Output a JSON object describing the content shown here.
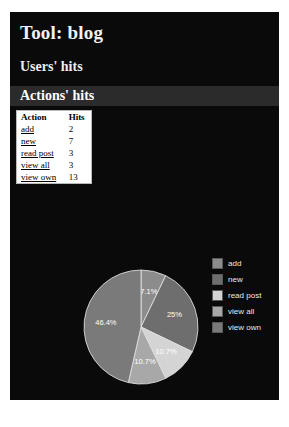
{
  "page": {
    "title": "Tool: blog",
    "section_users": "Users' hits",
    "section_actions": "Actions' hits",
    "background_color": "#0a0a0a",
    "highlight_band_color": "#2b2b2b"
  },
  "table": {
    "headers": [
      "Action",
      "Hits"
    ],
    "rows": [
      {
        "action": "add",
        "hits": "2"
      },
      {
        "action": "new",
        "hits": "7"
      },
      {
        "action": "read post",
        "hits": "3"
      },
      {
        "action": "view all",
        "hits": "3"
      },
      {
        "action": "view own",
        "hits": "13"
      }
    ]
  },
  "legend": {
    "items": [
      {
        "label": "add",
        "color": "#8c8c8c"
      },
      {
        "label": "new",
        "color": "#6e6e6e"
      },
      {
        "label": "read post",
        "color": "#d4d4d4"
      },
      {
        "label": "view all",
        "color": "#a8a8a8"
      },
      {
        "label": "view own",
        "color": "#7a7a7a"
      }
    ]
  },
  "chart_data": {
    "type": "pie",
    "title": "Actions' hits",
    "categories": [
      "add",
      "new",
      "read post",
      "view all",
      "view own"
    ],
    "values": [
      2,
      7,
      3,
      3,
      13
    ],
    "total": 28,
    "percent_labels": [
      "7.1%",
      "25%",
      "10.7%",
      "10.7%",
      "46.4%"
    ],
    "colors": [
      "#8c8c8c",
      "#6e6e6e",
      "#d4d4d4",
      "#a8a8a8",
      "#7a7a7a"
    ],
    "legend_position": "right",
    "grid": false,
    "xlabel": "",
    "ylabel": ""
  }
}
